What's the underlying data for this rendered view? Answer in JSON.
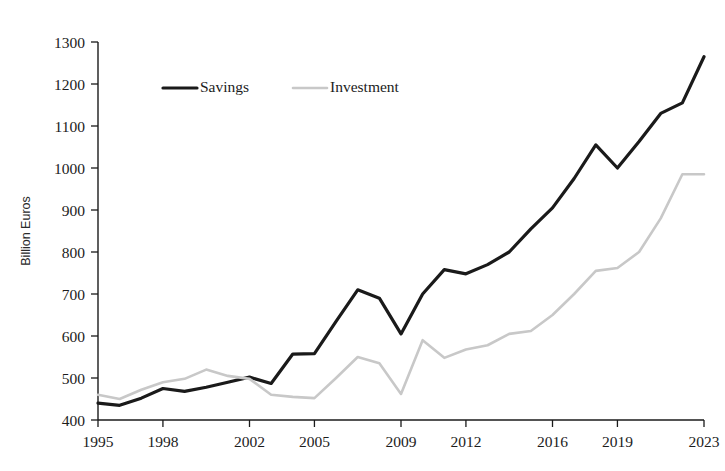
{
  "chart_data": {
    "type": "line",
    "title": "",
    "xlabel": "",
    "ylabel": "Billion Euros",
    "ylim": [
      400,
      1300
    ],
    "ytick_values": [
      400,
      500,
      600,
      700,
      800,
      900,
      1000,
      1100,
      1200,
      1300
    ],
    "ytick_labels": [
      "400",
      "500",
      "600",
      "700",
      "800",
      "900",
      "1000",
      "1100",
      "1200",
      "1300"
    ],
    "xlim": [
      1995,
      2023
    ],
    "xtick_values": [
      1995,
      1998,
      2002,
      2005,
      2009,
      2012,
      2016,
      2019,
      2023
    ],
    "xtick_labels": [
      "1995",
      "1998",
      "2002",
      "2005",
      "2009",
      "2012",
      "2016",
      "2019",
      "2023"
    ],
    "grid": false,
    "legend_position": "top-left-inside",
    "x": [
      1995,
      1996,
      1997,
      1998,
      1999,
      2000,
      2001,
      2002,
      2003,
      2004,
      2005,
      2006,
      2007,
      2008,
      2009,
      2010,
      2011,
      2012,
      2013,
      2014,
      2015,
      2016,
      2017,
      2018,
      2019,
      2020,
      2021,
      2022,
      2023
    ],
    "series": [
      {
        "name": "Savings",
        "color": "#1a1a1a",
        "width": 3.2,
        "values": [
          440,
          435,
          452,
          475,
          468,
          478,
          490,
          502,
          487,
          557,
          558,
          635,
          710,
          690,
          605,
          700,
          758,
          748,
          770,
          800,
          855,
          905,
          975,
          1055,
          1000,
          1063,
          1130,
          1155,
          1265
        ]
      },
      {
        "name": "Investment",
        "color": "#c8c8c8",
        "width": 2.6,
        "values": [
          460,
          450,
          472,
          490,
          498,
          520,
          505,
          498,
          460,
          455,
          452,
          500,
          550,
          535,
          462,
          590,
          548,
          568,
          578,
          605,
          612,
          650,
          700,
          755,
          762,
          800,
          880,
          985,
          985
        ]
      }
    ]
  },
  "legend": {
    "items": [
      {
        "label": "Savings",
        "color": "#1a1a1a"
      },
      {
        "label": "Investment",
        "color": "#c8c8c8"
      }
    ]
  }
}
